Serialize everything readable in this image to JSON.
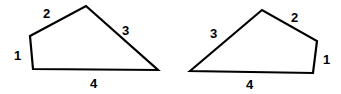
{
  "diagram": {
    "shapes": [
      {
        "id": "left-quadrilateral",
        "points": [
          [
            30,
            36
          ],
          [
            86,
            6
          ],
          [
            158,
            70
          ],
          [
            33,
            69
          ]
        ],
        "side_labels": [
          {
            "text": "1",
            "x": 14,
            "y": 60
          },
          {
            "text": "2",
            "x": 43,
            "y": 18
          },
          {
            "text": "3",
            "x": 122,
            "y": 35
          },
          {
            "text": "4",
            "x": 90,
            "y": 88
          }
        ]
      },
      {
        "id": "right-quadrilateral",
        "points": [
          [
            190,
            71
          ],
          [
            262,
            10
          ],
          [
            317,
            41
          ],
          [
            313,
            73
          ]
        ],
        "side_labels": [
          {
            "text": "3",
            "x": 210,
            "y": 38
          },
          {
            "text": "2",
            "x": 291,
            "y": 22
          },
          {
            "text": "1",
            "x": 323,
            "y": 64
          },
          {
            "text": "4",
            "x": 246,
            "y": 89
          }
        ]
      }
    ],
    "stroke_color": "#000000"
  }
}
